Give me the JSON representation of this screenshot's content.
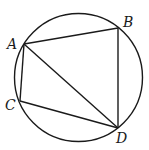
{
  "diagram": {
    "type": "inscribed-quadrilateral",
    "stroke_color": "#1a1a1a",
    "background": "#ffffff",
    "circle": {
      "cx": 78.5,
      "cy": 77.5,
      "r": 64
    },
    "points": {
      "A": {
        "label": "A",
        "x": 24,
        "y": 44,
        "label_x": 7,
        "label_y": 49
      },
      "B": {
        "label": "B",
        "x": 118,
        "y": 28,
        "label_x": 123,
        "label_y": 27
      },
      "C": {
        "label": "C",
        "x": 20,
        "y": 101,
        "label_x": 5,
        "label_y": 110
      },
      "D": {
        "label": "D",
        "x": 118,
        "y": 128,
        "label_x": 116,
        "label_y": 143
      }
    },
    "segments": [
      {
        "name": "AB",
        "from": "A",
        "to": "B"
      },
      {
        "name": "BD",
        "from": "B",
        "to": "D"
      },
      {
        "name": "AD",
        "from": "A",
        "to": "D"
      },
      {
        "name": "AC",
        "from": "A",
        "to": "C"
      },
      {
        "name": "CD",
        "from": "C",
        "to": "D"
      }
    ]
  }
}
